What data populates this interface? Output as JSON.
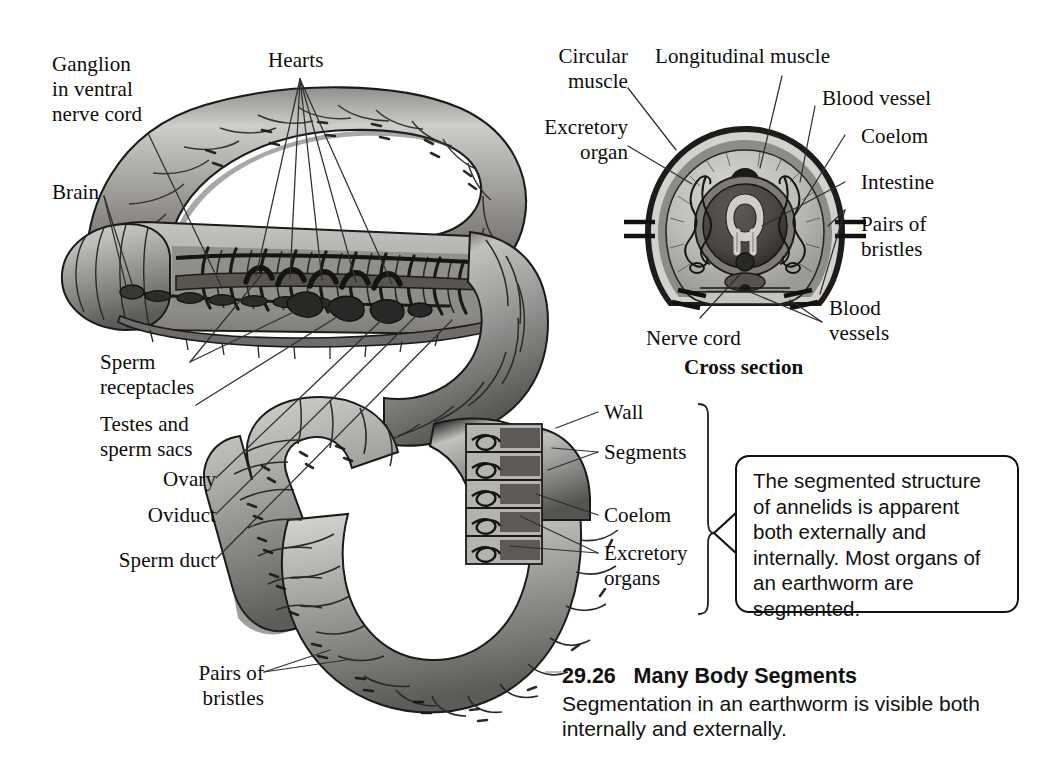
{
  "figure": {
    "number": "29.26",
    "title": "Many Body Segments",
    "caption": "Segmentation in an earthworm is visible both internally and externally."
  },
  "callout": {
    "text": "The segmented structure of annelids is apparent both externally and internally. Most organs of an earthworm are segmented."
  },
  "whole_worm_labels": {
    "ganglion": "Ganglion\nin ventral\nnerve cord",
    "hearts": "Hearts",
    "brain": "Brain",
    "sperm_receptacles": "Sperm\nreceptacles",
    "testes": "Testes and\nsperm sacs",
    "ovary": "Ovary",
    "oviduct": "Oviduct",
    "sperm_duct": "Sperm duct",
    "bristles": "Pairs of\nbristles"
  },
  "cutaway_labels": {
    "wall": "Wall",
    "segments": "Segments",
    "coelom": "Coelom",
    "excretory_organs": "Excretory\norgans"
  },
  "cross_section": {
    "heading": "Cross section",
    "circular_muscle": "Circular\nmuscle",
    "longitudinal_muscle": "Longitudinal muscle",
    "excretory_organ": "Excretory\norgan",
    "blood_vessel": "Blood vessel",
    "coelom": "Coelom",
    "intestine": "Intestine",
    "pairs_of_bristles": "Pairs of\nbristles",
    "blood_vessels": "Blood\nvessels",
    "nerve_cord": "Nerve cord"
  },
  "colors": {
    "ink": "#111111",
    "background": "#ffffff",
    "body_light": "#c9c7c4",
    "body_mid": "#9b9996",
    "body_dark": "#6d6a67",
    "body_deep": "#4a4745",
    "organ_dark": "#3d3b39",
    "leader": "#3a3a3a"
  }
}
